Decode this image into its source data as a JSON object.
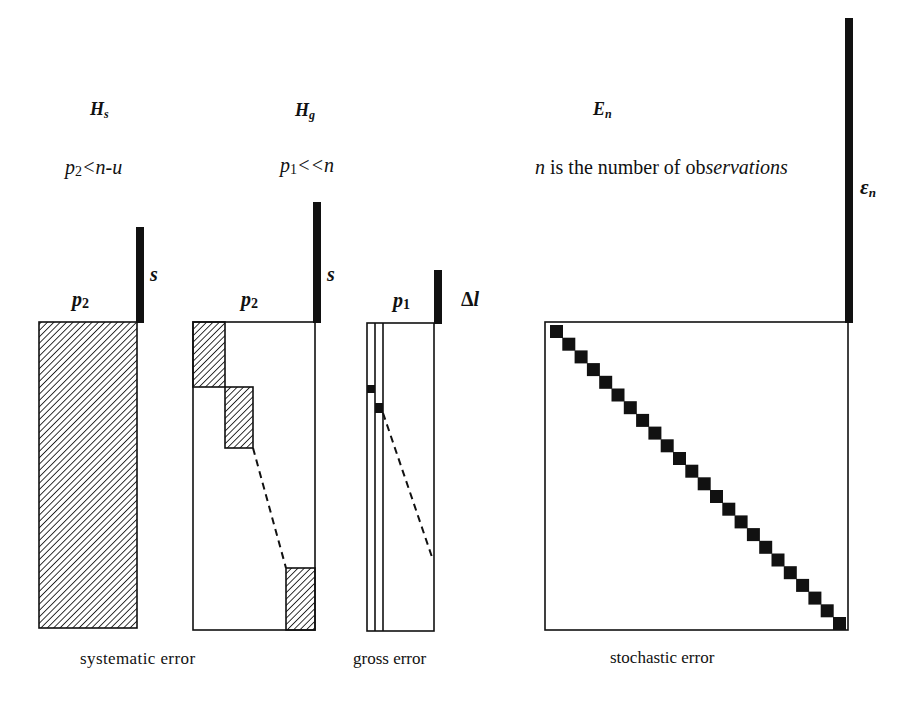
{
  "figure": {
    "panels": {
      "systematic": {
        "title": {
          "main": "H",
          "sub": "s"
        },
        "condition": {
          "var": "p",
          "sub": "2",
          "rest": "<n-u"
        },
        "column_label": {
          "main": "p",
          "sub": "2"
        },
        "bar_label": "s",
        "caption": "systematic error"
      },
      "gross_s": {
        "title": {
          "main": "H",
          "sub": "g"
        },
        "condition": {
          "var": "p",
          "sub": "1",
          "rest": "<<n"
        },
        "column_label": {
          "main": "p",
          "sub": "2"
        },
        "bar_label": "s"
      },
      "gross_l": {
        "column_label": {
          "main": "p",
          "sub": "1"
        },
        "bar_label": {
          "delta": "Δ",
          "var": "l"
        },
        "caption": "gross error"
      },
      "stochastic": {
        "title": {
          "main": "E",
          "sub": "n"
        },
        "note": {
          "var": "n",
          "text": " is the number of ob",
          "italic_text": "servations"
        },
        "bar_label": {
          "main": "ε",
          "sub": "n"
        },
        "caption": "stochastic error",
        "diagonal_block_count": 24
      }
    },
    "colors": {
      "ink": "#111111",
      "background": "#ffffff"
    }
  }
}
